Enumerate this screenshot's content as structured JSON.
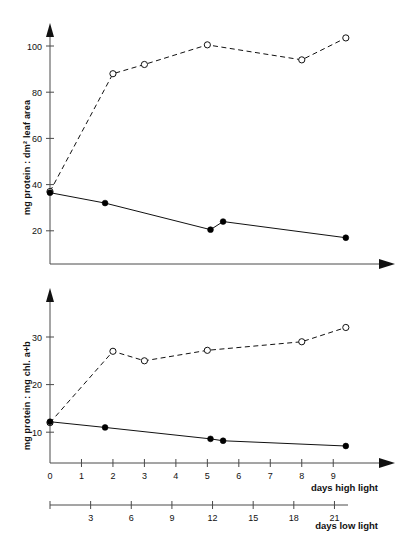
{
  "chart_data": [
    {
      "type": "line",
      "title": "",
      "panel": "top",
      "xlabel": "days high light",
      "ylabel": "mg protein : dm² leaf area",
      "xlim": [
        0,
        10.2
      ],
      "ylim": [
        0,
        112
      ],
      "yticks": [
        20,
        40,
        60,
        80,
        100
      ],
      "ytick_labels": [
        "20",
        "40",
        "60",
        "80",
        "100"
      ],
      "xticks": [],
      "xtick_labels": [],
      "grid": false,
      "legend": "none",
      "series": [
        {
          "name": "low light (open circles, dashed)",
          "marker": "open-circle",
          "line": "dashed",
          "x": [
            0,
            2.0,
            3.0,
            5.0,
            8.0,
            9.4
          ],
          "values": [
            37,
            88,
            92,
            100.5,
            94,
            103.5
          ]
        },
        {
          "name": "high light (filled circles, solid)",
          "marker": "filled-circle",
          "line": "solid",
          "x": [
            0,
            1.75,
            5.1,
            5.5,
            9.4
          ],
          "values": [
            36.5,
            32,
            20.5,
            24,
            17
          ]
        }
      ]
    },
    {
      "type": "line",
      "title": "",
      "panel": "bottom",
      "xlabel": "days high light",
      "xlabel_secondary": "days low light",
      "ylabel": "mg protein : mg chl. a+b",
      "xlim": [
        0,
        10.2
      ],
      "ylim": [
        0,
        37
      ],
      "yticks": [
        10,
        20,
        30
      ],
      "ytick_labels": [
        "10",
        "20",
        "30"
      ],
      "xticks": [
        0,
        1,
        2,
        3,
        4,
        5,
        6,
        7,
        8,
        9
      ],
      "xtick_labels": [
        "0",
        "1",
        "2",
        "3",
        "4",
        "5",
        "6",
        "7",
        "8",
        "9"
      ],
      "xticks_secondary": [
        3,
        6,
        9,
        12,
        15,
        18,
        21
      ],
      "xtick_labels_secondary": [
        "3",
        "6",
        "9",
        "12",
        "15",
        "18",
        "21"
      ],
      "grid": false,
      "legend": "none",
      "series": [
        {
          "name": "low light (open circles, dashed)",
          "marker": "open-circle",
          "line": "dashed",
          "x": [
            0,
            2.0,
            3.0,
            5.0,
            8.0,
            9.4
          ],
          "values": [
            12.0,
            27.0,
            25.0,
            27.2,
            29.0,
            32.0
          ]
        },
        {
          "name": "high light (filled circles, solid)",
          "marker": "filled-circle",
          "line": "solid",
          "x": [
            0,
            1.75,
            5.1,
            5.5,
            9.4
          ],
          "values": [
            12.2,
            11.0,
            8.6,
            8.2,
            7.1
          ]
        }
      ]
    }
  ],
  "colors": {
    "line": "#111111",
    "axis": "#4a4a4a",
    "background": "#ffffff"
  }
}
